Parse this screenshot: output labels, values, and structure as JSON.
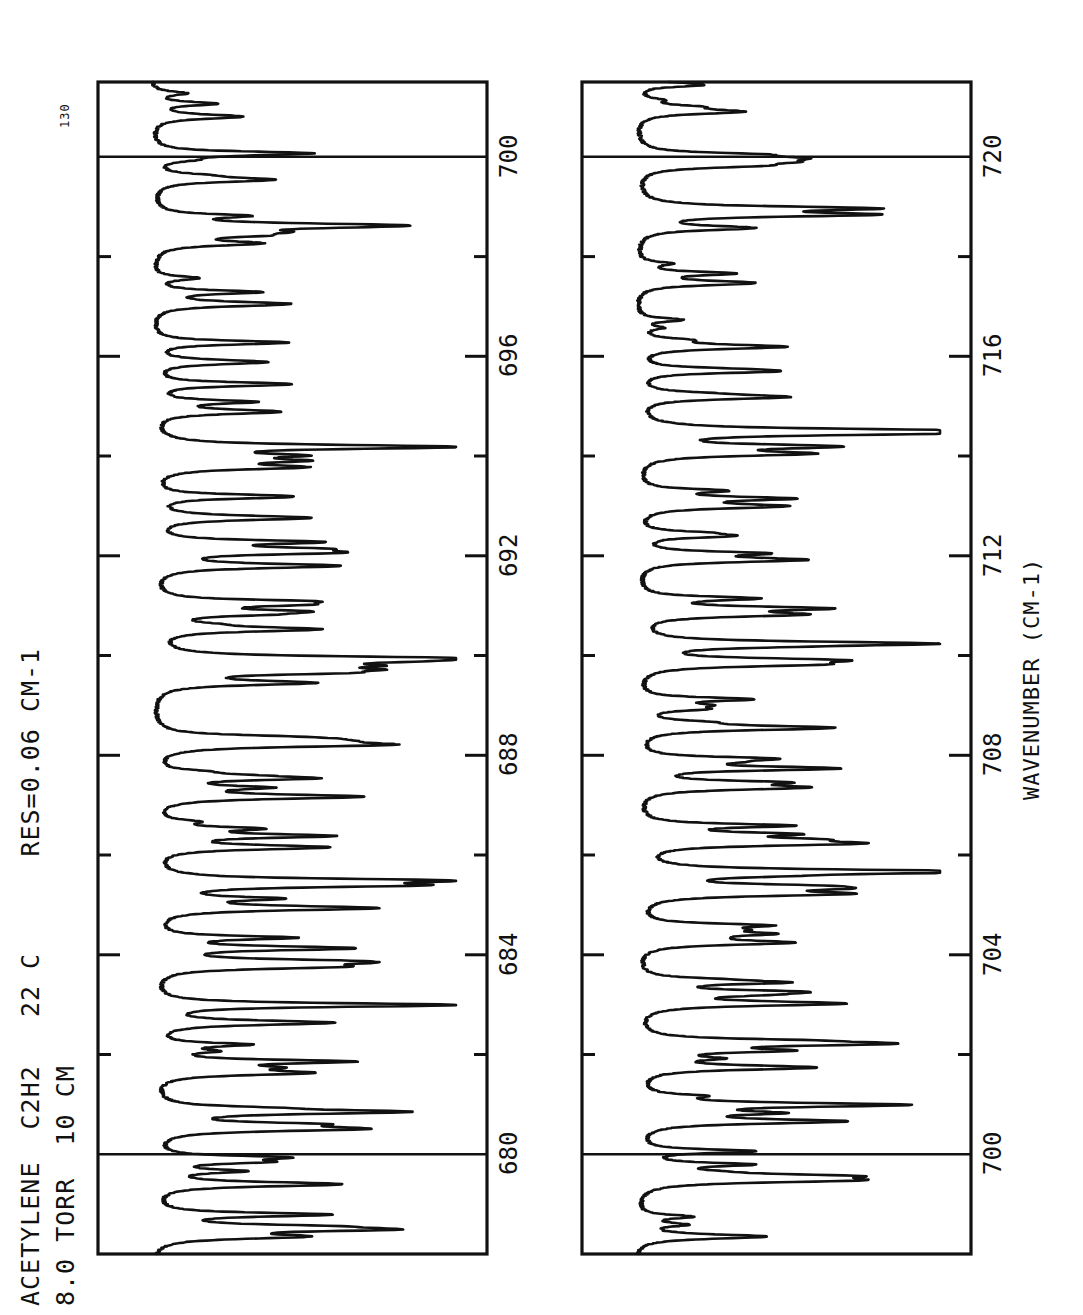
{
  "header": {
    "line1": "ACETYLENE  C2H2   22 C      RES=0.06 CM-1",
    "line2": "8.0 TORR  10 CM",
    "scale_label": "130"
  },
  "axis": {
    "title": "WAVENUMBER (CM-1)"
  },
  "colors": {
    "ink": "#111111",
    "paper": "#ffffff"
  },
  "chart_data": {
    "type": "line",
    "title": "ACETYLENE  C2H2   22 C      RES=0.06 CM-1",
    "subtitle": "8.0 TORR  10 CM",
    "orientation": "rotated-90ccw",
    "xlabel": "WAVENUMBER (CM-1)",
    "ylabel": "",
    "grid": true,
    "legend": null,
    "scale_marker": "130",
    "panels": [
      {
        "name": "upper-panel",
        "xlim": [
          678,
          701.5
        ],
        "major_ticks": [
          680,
          684,
          688,
          692,
          696,
          700
        ],
        "minor_ticks": [
          682,
          686,
          690,
          694,
          698
        ],
        "gridlines": [
          680,
          700
        ],
        "tick_labels": [
          "680",
          "684",
          "688",
          "692",
          "696",
          "700"
        ],
        "ylim": [
          0,
          130
        ],
        "description": "IR absorption band of acetylene, nu5 bending region, 678-701 cm-1"
      },
      {
        "name": "lower-panel",
        "xlim": [
          698,
          721.5
        ],
        "major_ticks": [
          700,
          704,
          708,
          712,
          716,
          720
        ],
        "minor_ticks": [
          702,
          706,
          710,
          714,
          718
        ],
        "gridlines": [
          700,
          720
        ],
        "tick_labels": [
          "700",
          "704",
          "708",
          "712",
          "716",
          "720"
        ],
        "ylim": [
          0,
          130
        ],
        "description": "IR absorption band of acetylene, nu5 bending region, 698-721 cm-1"
      }
    ]
  }
}
